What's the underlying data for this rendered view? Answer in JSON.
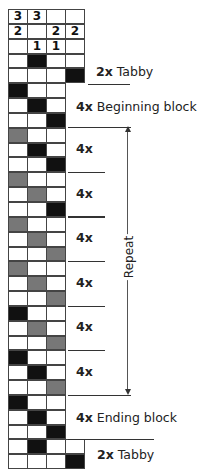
{
  "draft": {
    "header_rows": [
      [
        "3",
        "3",
        "",
        ""
      ],
      [
        "2",
        "",
        "2",
        "2"
      ],
      [
        "",
        "1",
        "1",
        ""
      ]
    ],
    "rows": [
      [
        "w",
        "k",
        "w",
        "w"
      ],
      [
        "w",
        "w",
        "w",
        "k"
      ],
      [
        "k",
        "w",
        "w"
      ],
      [
        "w",
        "k",
        "w"
      ],
      [
        "w",
        "w",
        "k"
      ],
      [
        "g",
        "w",
        "w"
      ],
      [
        "w",
        "k",
        "w"
      ],
      [
        "w",
        "w",
        "k"
      ],
      [
        "g",
        "w",
        "w"
      ],
      [
        "w",
        "g",
        "w"
      ],
      [
        "w",
        "w",
        "k"
      ],
      [
        "g",
        "w",
        "w"
      ],
      [
        "w",
        "g",
        "w"
      ],
      [
        "w",
        "w",
        "g"
      ],
      [
        "g",
        "w",
        "w"
      ],
      [
        "w",
        "g",
        "w"
      ],
      [
        "w",
        "w",
        "g"
      ],
      [
        "k",
        "w",
        "w"
      ],
      [
        "w",
        "g",
        "w"
      ],
      [
        "w",
        "w",
        "g"
      ],
      [
        "k",
        "w",
        "w"
      ],
      [
        "w",
        "k",
        "w"
      ],
      [
        "w",
        "w",
        "g"
      ],
      [
        "k",
        "w",
        "w"
      ],
      [
        "w",
        "k",
        "w"
      ],
      [
        "w",
        "w",
        "k"
      ],
      [
        "w",
        "k",
        "w",
        "w"
      ],
      [
        "w",
        "w",
        "w",
        "k"
      ]
    ],
    "colors": {
      "black": "#111111",
      "gray": "#777777",
      "white": "#ffffff"
    }
  },
  "labels": {
    "tabby_top": {
      "count": "2x",
      "text": " Tabby"
    },
    "beginning": {
      "count": "4x",
      "text": " Beginning block"
    },
    "repeat_blocks": [
      "4x",
      "4x",
      "4x",
      "4x",
      "4x",
      "4x"
    ],
    "repeat": "Repeat",
    "ending": {
      "count": "4x",
      "text": " Ending block"
    },
    "tabby_bottom": {
      "count": "2x",
      "text": " Tabby"
    }
  }
}
